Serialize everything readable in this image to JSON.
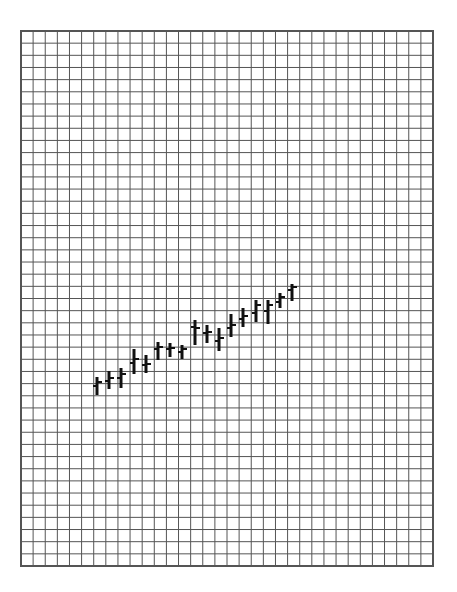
{
  "chart_data": {
    "type": "ohlc",
    "title": "",
    "xlabel": "",
    "ylabel": "",
    "grid": true,
    "legend": null,
    "plot_area": {
      "left": 21,
      "top": 31,
      "right": 433,
      "bottom": 566
    },
    "grid_columns": 34,
    "grid_rows": 44,
    "colors": {
      "background": "#ffffff",
      "grid": "#555555",
      "border": "#555555",
      "bars": "#111111"
    },
    "note": "Values in pixel y-coordinates (lower = higher price); no axis ticks shown.",
    "bars": [
      {
        "x": 97,
        "high": 377,
        "low": 395,
        "open": 386,
        "close": 382
      },
      {
        "x": 109,
        "high": 371,
        "low": 389,
        "open": 381,
        "close": 378
      },
      {
        "x": 121,
        "high": 368,
        "low": 388,
        "open": 378,
        "close": 374
      },
      {
        "x": 134,
        "high": 349,
        "low": 374,
        "open": 363,
        "close": 359
      },
      {
        "x": 146,
        "high": 355,
        "low": 373,
        "open": 365,
        "close": 364
      },
      {
        "x": 158,
        "high": 342,
        "low": 360,
        "open": 349,
        "close": 347
      },
      {
        "x": 170,
        "high": 343,
        "low": 357,
        "open": 349,
        "close": 348
      },
      {
        "x": 182,
        "high": 345,
        "low": 359,
        "open": 352,
        "close": 349
      },
      {
        "x": 195,
        "high": 320,
        "low": 345,
        "open": 327,
        "close": 328
      },
      {
        "x": 207,
        "high": 325,
        "low": 343,
        "open": 333,
        "close": 332
      },
      {
        "x": 219,
        "high": 328,
        "low": 351,
        "open": 341,
        "close": 338
      },
      {
        "x": 231,
        "high": 314,
        "low": 337,
        "open": 328,
        "close": 325
      },
      {
        "x": 243,
        "high": 308,
        "low": 327,
        "open": 319,
        "close": 316
      },
      {
        "x": 256,
        "high": 300,
        "low": 322,
        "open": 313,
        "close": 305
      },
      {
        "x": 268,
        "high": 300,
        "low": 324,
        "open": 311,
        "close": 305
      },
      {
        "x": 280,
        "high": 293,
        "low": 308,
        "open": 302,
        "close": 297
      },
      {
        "x": 292,
        "high": 284,
        "low": 301,
        "open": 290,
        "close": 287
      }
    ]
  }
}
